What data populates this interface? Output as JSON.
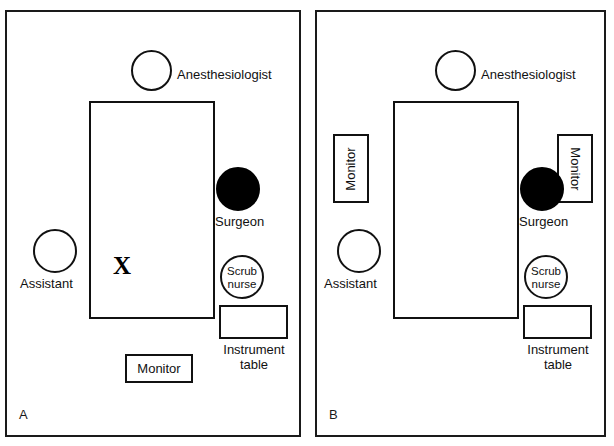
{
  "figure": {
    "width": 614,
    "height": 446,
    "line_color": "#111111",
    "background": "#ffffff",
    "filled_marker_color": "#000000"
  },
  "panels": [
    {
      "id": "A",
      "label": "A",
      "caption": "Standard setup with single monitor at foot of table",
      "operating_table": {
        "label": "operating table",
        "marker": "X"
      },
      "personnel": [
        {
          "role": "Anesthesiologist",
          "label": "Anesthesiologist",
          "style": "open-circle",
          "label_placement": "right"
        },
        {
          "role": "Surgeon",
          "label": "Surgeon",
          "style": "filled-circle",
          "label_placement": "below"
        },
        {
          "role": "Assistant",
          "label": "Assistant",
          "style": "open-circle",
          "label_placement": "below"
        },
        {
          "role": "Scrub nurse",
          "label": "Scrub\nnurse",
          "style": "open-circle",
          "label_placement": "inside"
        }
      ],
      "equipment": [
        {
          "name": "Instrument table",
          "label": "Instrument\ntable",
          "label_placement": "below",
          "orientation": "horizontal"
        },
        {
          "name": "Monitor",
          "label": "Monitor",
          "label_placement": "inside",
          "orientation": "horizontal"
        }
      ]
    },
    {
      "id": "B",
      "label": "B",
      "caption": "Dual monitor setup with monitors flanking the table",
      "operating_table": {
        "label": "operating table",
        "marker": ""
      },
      "personnel": [
        {
          "role": "Anesthesiologist",
          "label": "Anesthesiologist",
          "style": "open-circle",
          "label_placement": "right"
        },
        {
          "role": "Surgeon",
          "label": "Surgeon",
          "style": "filled-circle",
          "label_placement": "below"
        },
        {
          "role": "Assistant",
          "label": "Assistant",
          "style": "open-circle",
          "label_placement": "below"
        },
        {
          "role": "Scrub nurse",
          "label": "Scrub\nnurse",
          "style": "open-circle",
          "label_placement": "inside"
        }
      ],
      "equipment": [
        {
          "name": "Monitor left",
          "label": "Monitor",
          "label_placement": "inside",
          "orientation": "vertical-ccw"
        },
        {
          "name": "Monitor right",
          "label": "Monitor",
          "label_placement": "inside",
          "orientation": "vertical-cw"
        },
        {
          "name": "Instrument table",
          "label": "Instrument\ntable",
          "label_placement": "below",
          "orientation": "horizontal"
        }
      ]
    }
  ]
}
